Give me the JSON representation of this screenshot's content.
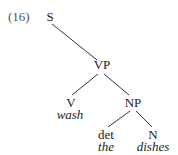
{
  "example_number": "(16)",
  "tree": {
    "root": {
      "label": "S"
    },
    "vp": {
      "label": "VP"
    },
    "v": {
      "label": "V",
      "word": "wash"
    },
    "np": {
      "label": "NP"
    },
    "det": {
      "label": "det",
      "word": "the"
    },
    "n": {
      "label": "N",
      "word": "dishes"
    }
  },
  "colors": {
    "line": "#333333",
    "text": "#222222",
    "number": "#555555"
  }
}
